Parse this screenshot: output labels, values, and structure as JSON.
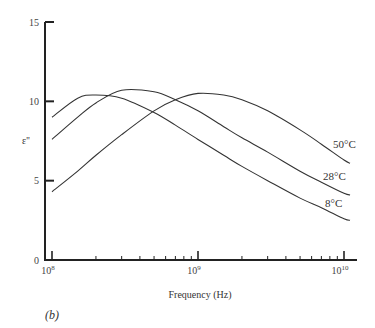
{
  "chart_data": {
    "type": "line",
    "title": "",
    "panel_label": "(b)",
    "xlabel": "Frequency (Hz)",
    "ylabel": "ε''",
    "xscale": "log",
    "xlim": [
      100000000,
      12000000000
    ],
    "ylim": [
      0,
      15
    ],
    "x_ticks": [
      {
        "value": 100000000,
        "label_base": "10",
        "label_exp": "8"
      },
      {
        "value": 1000000000,
        "label_base": "10",
        "label_exp": "9"
      },
      {
        "value": 10000000000,
        "label_base": "10",
        "label_exp": "10"
      }
    ],
    "y_ticks": [
      0,
      5,
      10,
      15
    ],
    "grid": false,
    "legend": "inline labels at right end of curves",
    "series": [
      {
        "name": "50°C",
        "x": [
          100000000,
          150000000,
          200000000,
          300000000,
          500000000,
          700000000,
          1000000000,
          1500000000,
          2000000000,
          3000000000,
          5000000000,
          7000000000,
          10000000000,
          11000000000
        ],
        "values": [
          4.3,
          5.6,
          6.6,
          7.9,
          9.4,
          10.1,
          10.5,
          10.4,
          10.1,
          9.4,
          8.2,
          7.3,
          6.3,
          6.1
        ]
      },
      {
        "name": "28°C",
        "x": [
          100000000,
          150000000,
          200000000,
          300000000,
          500000000,
          700000000,
          1000000000,
          1500000000,
          2000000000,
          3000000000,
          5000000000,
          7000000000,
          10000000000,
          11000000000
        ],
        "values": [
          7.6,
          9.0,
          9.9,
          10.7,
          10.6,
          10.1,
          9.4,
          8.4,
          7.7,
          6.8,
          5.6,
          4.9,
          4.2,
          4.1
        ]
      },
      {
        "name": "8°C",
        "x": [
          100000000,
          150000000,
          200000000,
          300000000,
          500000000,
          700000000,
          1000000000,
          1500000000,
          2000000000,
          3000000000,
          5000000000,
          7000000000,
          10000000000,
          11000000000
        ],
        "values": [
          9.0,
          10.2,
          10.4,
          10.2,
          9.3,
          8.5,
          7.6,
          6.6,
          5.9,
          5.0,
          3.9,
          3.3,
          2.6,
          2.5
        ]
      }
    ]
  }
}
